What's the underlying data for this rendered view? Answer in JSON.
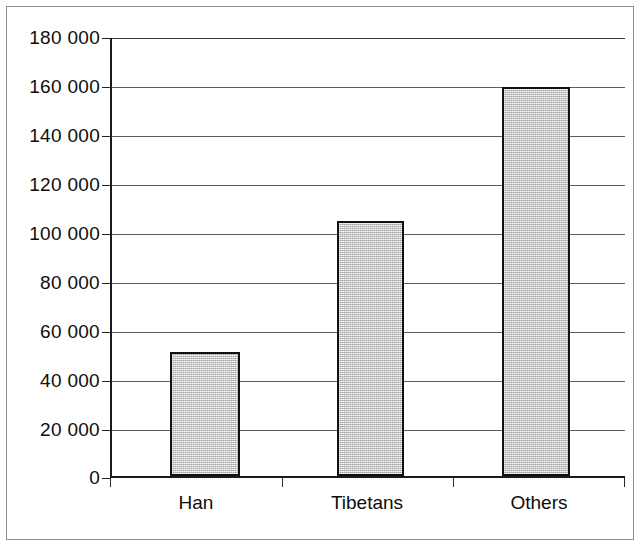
{
  "chart_data": {
    "type": "bar",
    "title": "",
    "subtitle": "",
    "xlabel": "",
    "ylabel": "",
    "categories": [
      "Han",
      "Tibetans",
      "Others"
    ],
    "values": [
      51000,
      105000,
      160000
    ],
    "value_labels": [
      "51 000",
      "105 000",
      "160 000"
    ],
    "ylim": [
      0,
      180000
    ],
    "ytick_values": [
      180000,
      160000,
      140000,
      120000,
      100000,
      80000,
      60000,
      40000,
      20000,
      0
    ],
    "ytick_labels": [
      "180 000",
      "160 000",
      "140 000",
      "120 000",
      "100 000",
      "80 000",
      "60 000",
      "40 000",
      "20 000",
      "0"
    ],
    "ytick_interval": 20000,
    "grid": true,
    "grid_axis": "y",
    "legend": false,
    "legend_position": "none",
    "series": [
      {
        "name": "Population",
        "values": [
          51000,
          105000,
          160000
        ]
      }
    ],
    "annotations": [],
    "colors": {
      "bar_fill": "#cfcfcf",
      "bar_border": "#111111",
      "gridline": "#5d5d5d",
      "axis": "#1a1a1a",
      "text": "#0d0d0d",
      "background": "#ffffff",
      "page_border": "#8d8d8d"
    }
  }
}
